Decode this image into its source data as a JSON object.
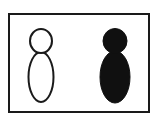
{
  "image": {
    "title": "Two stylized human-like figures in a bordered panel",
    "width": 158,
    "height": 124,
    "background_color": "#ffffff"
  },
  "frame": {
    "name": "panel-border",
    "x": 8,
    "y": 13,
    "width": 142,
    "height": 100,
    "stroke_color": "#1a1a1a",
    "stroke_width": 2,
    "fill_color": "#ffffff"
  },
  "figures": [
    {
      "id": "figure-outline",
      "label": "outline figure",
      "style": "outline",
      "fill_color": "none",
      "stroke_color": "#1a1a1a",
      "stroke_width": 2,
      "head": {
        "shape": "ellipse",
        "cx": 41,
        "cy": 41,
        "rx": 11,
        "ry": 12
      },
      "body": {
        "shape": "ellipse",
        "cx": 41,
        "cy": 77,
        "rx": 12.5,
        "ry": 25
      }
    },
    {
      "id": "figure-filled",
      "label": "filled figure",
      "style": "solid",
      "fill_color": "#101010",
      "stroke_color": "#101010",
      "stroke_width": 1,
      "head": {
        "shape": "ellipse",
        "cx": 115,
        "cy": 41,
        "rx": 12,
        "ry": 12.5
      },
      "body": {
        "shape": "ellipse",
        "cx": 115,
        "cy": 77,
        "rx": 15,
        "ry": 26
      }
    }
  ]
}
